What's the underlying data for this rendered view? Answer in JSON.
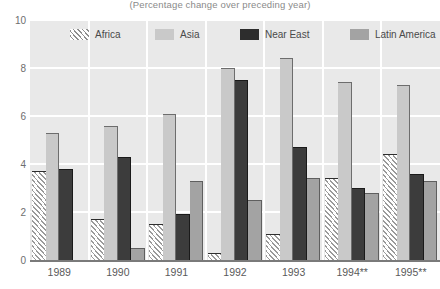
{
  "chart_data": {
    "type": "bar",
    "title": "(Percentage change over preceding year)",
    "xlabel": "",
    "ylabel": "",
    "ylim": [
      0,
      10
    ],
    "yticks": [
      0,
      2,
      4,
      6,
      8,
      10
    ],
    "grid": true,
    "legend_position": "top-inside",
    "categories": [
      "1989",
      "1990",
      "1991",
      "1992",
      "1993",
      "1994**",
      "1995**"
    ],
    "series": [
      {
        "name": "Africa",
        "style": "hatched",
        "color": "#ffffff",
        "values": [
          3.7,
          1.7,
          1.5,
          0.3,
          1.1,
          3.4,
          4.4
        ]
      },
      {
        "name": "Asia",
        "style": "solid",
        "color": "#c9c9c9",
        "values": [
          5.3,
          5.6,
          6.1,
          8.0,
          8.4,
          7.4,
          7.3
        ]
      },
      {
        "name": "Near East",
        "style": "solid",
        "color": "#2d2d2d",
        "values": [
          3.8,
          4.3,
          1.9,
          7.5,
          4.7,
          3.0,
          3.6
        ]
      },
      {
        "name": "Latin America",
        "style": "solid",
        "color": "#a3a3a3",
        "values": [
          null,
          0.5,
          3.3,
          2.5,
          3.4,
          2.8,
          3.3
        ]
      }
    ]
  },
  "legend": {
    "items": [
      {
        "label": "Africa",
        "swatch": "sw-africa",
        "left": 40
      },
      {
        "label": "Asia",
        "swatch": "sw-asia",
        "left": 125
      },
      {
        "label": "Near East",
        "swatch": "sw-neareast",
        "left": 210
      },
      {
        "label": "Latin America",
        "swatch": "sw-latin",
        "left": 320
      }
    ]
  }
}
